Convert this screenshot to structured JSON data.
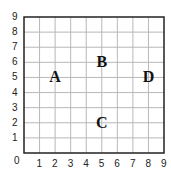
{
  "chart_data": {
    "type": "scatter",
    "title": "",
    "xlabel": "",
    "ylabel": "",
    "xlim": [
      0,
      9
    ],
    "ylim": [
      0,
      9
    ],
    "grid": true,
    "x_ticks": [
      "1",
      "2",
      "3",
      "4",
      "5",
      "6",
      "7",
      "8",
      "9"
    ],
    "y_ticks": [
      "1",
      "2",
      "3",
      "4",
      "5",
      "6",
      "7",
      "8",
      "9"
    ],
    "origin_label": "0",
    "points": [
      {
        "label": "A",
        "x": 2,
        "y": 5
      },
      {
        "label": "B",
        "x": 5,
        "y": 6
      },
      {
        "label": "C",
        "x": 5,
        "y": 2
      },
      {
        "label": "D",
        "x": 8,
        "y": 5
      }
    ]
  },
  "colors": {
    "grid": "#b8b8b8",
    "border": "#222222",
    "text": "#222222"
  }
}
